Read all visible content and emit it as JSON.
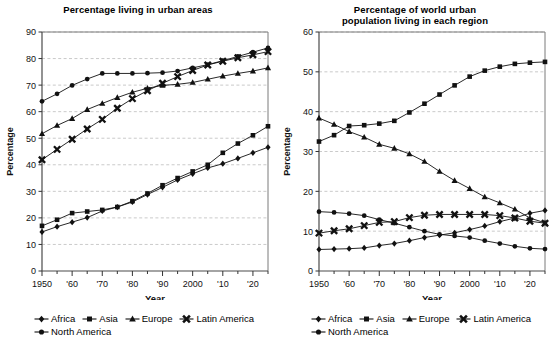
{
  "series_meta": [
    {
      "name": "Africa",
      "marker": "diamond"
    },
    {
      "name": "Asia",
      "marker": "square"
    },
    {
      "name": "Europe",
      "marker": "triangle"
    },
    {
      "name": "Latin America",
      "marker": "x"
    },
    {
      "name": "North America",
      "marker": "circle"
    }
  ],
  "legend": {
    "row1": [
      "Africa",
      "Asia",
      "Europe",
      "Latin America"
    ],
    "row2": [
      "North America"
    ]
  },
  "axis": {
    "ylabel": "Percentage",
    "xlabel": "Year"
  },
  "chart_data": [
    {
      "type": "line",
      "id": "urban-share",
      "title": "Percentage living in urban areas",
      "xlabel": "Year",
      "ylabel": "Percentage",
      "x": [
        1950,
        1955,
        1960,
        1965,
        1970,
        1975,
        1980,
        1985,
        1990,
        1995,
        2000,
        2005,
        2010,
        2015,
        2020,
        2025
      ],
      "xticks": [
        1950,
        1960,
        1970,
        1980,
        1990,
        2000,
        2010,
        2020
      ],
      "xticklabels": [
        "1950",
        "'60",
        "'70",
        "'80",
        "'90",
        "2000",
        "'10",
        "'20"
      ],
      "ylim": [
        0,
        90
      ],
      "yticks": [
        0,
        10,
        20,
        30,
        40,
        50,
        60,
        70,
        80,
        90
      ],
      "grid": true,
      "legend_position": "below",
      "series": [
        {
          "name": "Africa",
          "marker": "diamond",
          "values": [
            14.7,
            16.7,
            18.4,
            20.1,
            22.6,
            24.1,
            26.0,
            28.8,
            31.5,
            34.3,
            36.6,
            38.8,
            40.4,
            42.4,
            44.5,
            46.6
          ]
        },
        {
          "name": "Asia",
          "marker": "square",
          "values": [
            17.0,
            19.3,
            21.8,
            22.4,
            23.0,
            24.1,
            26.3,
            29.2,
            32.3,
            35.0,
            37.5,
            40.0,
            44.5,
            48.0,
            51.1,
            54.5
          ]
        },
        {
          "name": "Europe",
          "marker": "triangle",
          "values": [
            51.7,
            54.8,
            57.4,
            60.8,
            63.1,
            65.3,
            67.3,
            68.8,
            69.9,
            70.3,
            71.0,
            72.2,
            73.4,
            74.4,
            75.3,
            76.5
          ]
        },
        {
          "name": "Latin America",
          "marker": "x",
          "values": [
            41.9,
            45.8,
            49.6,
            53.5,
            57.1,
            61.3,
            64.9,
            67.9,
            70.7,
            73.2,
            75.5,
            77.6,
            79.0,
            80.3,
            81.4,
            82.6
          ]
        },
        {
          "name": "North America",
          "marker": "circle",
          "values": [
            63.9,
            66.7,
            69.9,
            72.3,
            74.4,
            74.4,
            74.4,
            74.5,
            74.7,
            75.3,
            76.5,
            77.7,
            79.2,
            80.8,
            82.4,
            84.0
          ]
        }
      ]
    },
    {
      "type": "line",
      "id": "world-urban-share-by-region",
      "title_line1": "Percentage of world urban",
      "title_line2": "population living in each region",
      "title": "Percentage of world urban population living in each region",
      "xlabel": "Year",
      "ylabel": "Percentage",
      "x": [
        1950,
        1955,
        1960,
        1965,
        1970,
        1975,
        1980,
        1985,
        1990,
        1995,
        2000,
        2005,
        2010,
        2015,
        2020,
        2025
      ],
      "xticks": [
        1950,
        1960,
        1970,
        1980,
        1990,
        2000,
        2010,
        2020
      ],
      "xticklabels": [
        "1950",
        "'60",
        "'70",
        "'80",
        "'90",
        "2000",
        "'10",
        "'20"
      ],
      "ylim": [
        0,
        60
      ],
      "yticks": [
        0,
        10,
        20,
        30,
        40,
        50,
        60
      ],
      "grid": true,
      "legend_position": "below",
      "series": [
        {
          "name": "Africa",
          "marker": "diamond",
          "values": [
            5.4,
            5.5,
            5.6,
            5.8,
            6.4,
            6.9,
            7.6,
            8.4,
            9.0,
            9.6,
            10.4,
            11.3,
            12.4,
            13.3,
            14.5,
            15.2
          ]
        },
        {
          "name": "Asia",
          "marker": "square",
          "values": [
            32.5,
            34.1,
            36.4,
            36.6,
            37.0,
            37.7,
            39.8,
            42.0,
            44.3,
            46.6,
            48.8,
            50.3,
            51.3,
            52.0,
            52.3,
            52.5
          ]
        },
        {
          "name": "Europe",
          "marker": "triangle",
          "values": [
            38.4,
            36.8,
            35.0,
            33.6,
            31.8,
            30.8,
            29.4,
            27.5,
            25.0,
            22.7,
            20.7,
            18.6,
            17.1,
            15.5,
            13.3,
            12.1
          ]
        },
        {
          "name": "Latin America",
          "marker": "x",
          "values": [
            9.5,
            10.1,
            10.6,
            11.4,
            12.2,
            12.4,
            13.4,
            14.0,
            14.2,
            14.2,
            14.2,
            14.2,
            13.9,
            13.3,
            12.5,
            12.0
          ]
        },
        {
          "name": "North America",
          "marker": "circle",
          "values": [
            14.9,
            14.7,
            14.4,
            13.9,
            12.9,
            12.0,
            11.0,
            10.0,
            9.2,
            8.8,
            8.4,
            7.6,
            6.9,
            6.2,
            5.7,
            5.5
          ]
        }
      ]
    }
  ]
}
